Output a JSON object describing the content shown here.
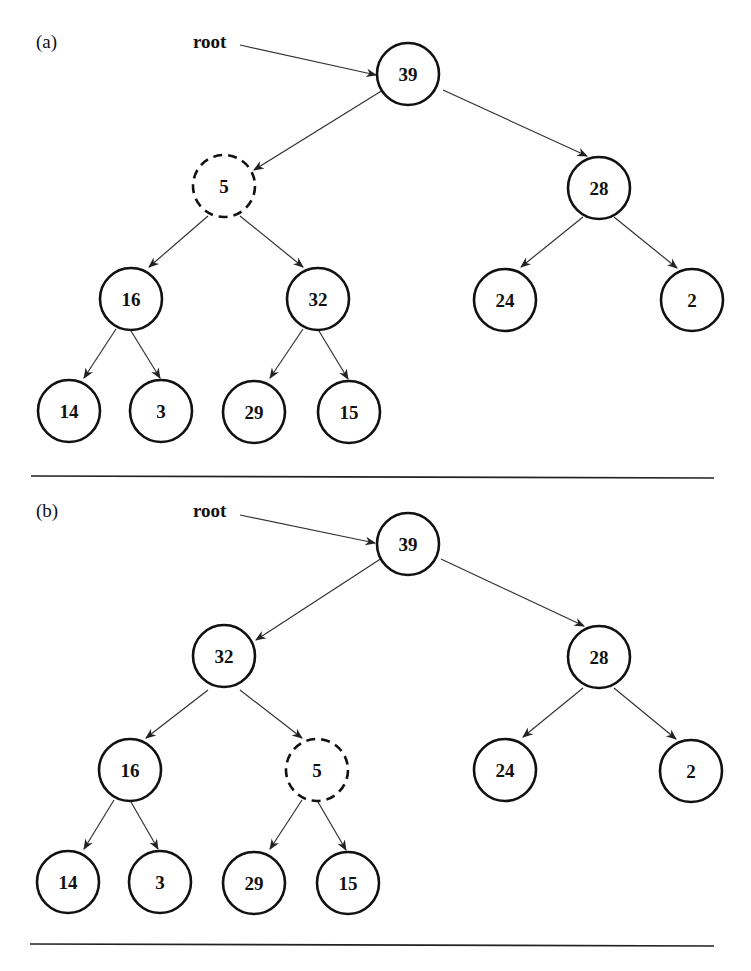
{
  "diagram": {
    "panels": [
      {
        "label": "(a)",
        "root_label": "root",
        "nodes": [
          {
            "id": "n39",
            "value": "39",
            "dashed": false
          },
          {
            "id": "n5",
            "value": "5",
            "dashed": true
          },
          {
            "id": "n28",
            "value": "28",
            "dashed": false
          },
          {
            "id": "n16",
            "value": "16",
            "dashed": false
          },
          {
            "id": "n32",
            "value": "32",
            "dashed": false
          },
          {
            "id": "n24",
            "value": "24",
            "dashed": false
          },
          {
            "id": "n2",
            "value": "2",
            "dashed": false
          },
          {
            "id": "n14",
            "value": "14",
            "dashed": false
          },
          {
            "id": "n3",
            "value": "3",
            "dashed": false
          },
          {
            "id": "n29",
            "value": "29",
            "dashed": false
          },
          {
            "id": "n15",
            "value": "15",
            "dashed": false
          }
        ],
        "edges": [
          [
            "39",
            "5"
          ],
          [
            "39",
            "28"
          ],
          [
            "5",
            "16"
          ],
          [
            "5",
            "32"
          ],
          [
            "28",
            "24"
          ],
          [
            "28",
            "2"
          ],
          [
            "16",
            "14"
          ],
          [
            "16",
            "3"
          ],
          [
            "32",
            "29"
          ],
          [
            "32",
            "15"
          ]
        ]
      },
      {
        "label": "(b)",
        "root_label": "root",
        "nodes": [
          {
            "id": "n39",
            "value": "39",
            "dashed": false
          },
          {
            "id": "n32",
            "value": "32",
            "dashed": false
          },
          {
            "id": "n28",
            "value": "28",
            "dashed": false
          },
          {
            "id": "n16",
            "value": "16",
            "dashed": false
          },
          {
            "id": "n5",
            "value": "5",
            "dashed": true
          },
          {
            "id": "n24",
            "value": "24",
            "dashed": false
          },
          {
            "id": "n2",
            "value": "2",
            "dashed": false
          },
          {
            "id": "n14",
            "value": "14",
            "dashed": false
          },
          {
            "id": "n3",
            "value": "3",
            "dashed": false
          },
          {
            "id": "n29",
            "value": "29",
            "dashed": false
          },
          {
            "id": "n15",
            "value": "15",
            "dashed": false
          }
        ],
        "edges": [
          [
            "39",
            "32"
          ],
          [
            "39",
            "28"
          ],
          [
            "32",
            "16"
          ],
          [
            "32",
            "5"
          ],
          [
            "28",
            "24"
          ],
          [
            "28",
            "2"
          ],
          [
            "16",
            "14"
          ],
          [
            "16",
            "3"
          ],
          [
            "5",
            "29"
          ],
          [
            "5",
            "15"
          ]
        ]
      }
    ]
  }
}
